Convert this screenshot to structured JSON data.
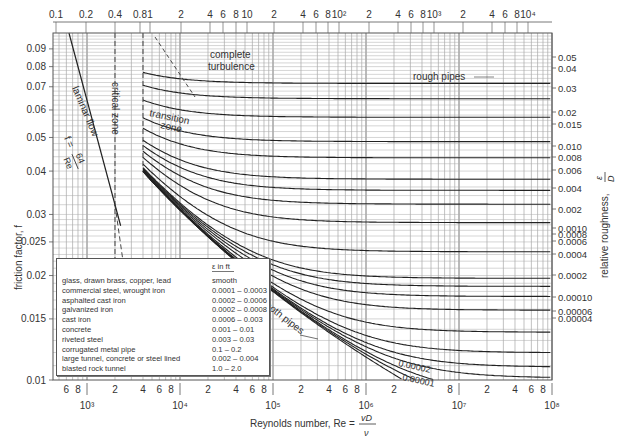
{
  "chart_data": {
    "type": "line",
    "xlabel": "Reynolds number, Re = vD/ν",
    "xlabel_main": "Reynolds number, Re =",
    "xlabel_num": "vD",
    "xlabel_den": "ν",
    "ylabel": "friction factor, f",
    "y2label": "relative roughness, ε/D",
    "y2label_main": "relative roughness,",
    "y2label_num": "ε",
    "y2label_den": "D",
    "xscale": "log",
    "yscale": "log",
    "xlim": [
      430,
      100000000
    ],
    "ylim": [
      0.01,
      0.1
    ],
    "grid": true,
    "y_ticks": [
      "0.09",
      "0.08",
      "0.07",
      "0.06",
      "0.05",
      "0.04",
      "0.03",
      "0.025",
      "0.02",
      "0.015",
      "0.01"
    ],
    "y_tick_values": [
      0.09,
      0.08,
      0.07,
      0.06,
      0.05,
      0.04,
      0.03,
      0.025,
      0.02,
      0.015,
      0.01
    ],
    "x_major_ticks": [
      "10³",
      "10⁴",
      "10⁵",
      "10⁶",
      "10⁷",
      "10⁸"
    ],
    "x_major_values": [
      1000,
      10000,
      100000,
      1000000,
      10000000,
      100000000
    ],
    "x_minor_tick_labels": [
      "6",
      "8",
      "2",
      "4",
      "6",
      "8",
      "2",
      "4",
      "6",
      "8",
      "2",
      "4",
      "6",
      "8",
      "2",
      "8",
      "2",
      "4",
      "6",
      "8"
    ],
    "top_axis_labels": [
      "0.1",
      "0.2",
      "0.4",
      "0.8",
      "1",
      "2",
      "4",
      "6",
      "8",
      "10",
      "2",
      "4",
      "6",
      "8",
      "10²",
      "2",
      "4",
      "6",
      "8",
      "10³",
      "2",
      "4",
      "6",
      "8",
      "10⁴"
    ],
    "relative_roughness_labels": [
      "0.05",
      "0.04",
      "0.03",
      "0.02",
      "0.015",
      "0.010",
      "0.008",
      "0.006",
      "0.004",
      "0.002",
      "0.0010",
      "0.0008",
      "0.0006",
      "0.0004",
      "0.0002",
      "0.00010",
      "0.00006",
      "0.00004"
    ],
    "relative_roughness_values": [
      0.05,
      0.04,
      0.03,
      0.02,
      0.015,
      0.01,
      0.008,
      0.006,
      0.004,
      0.002,
      0.001,
      0.0008,
      0.0006,
      0.0004,
      0.0002,
      0.0001,
      6e-05,
      4e-05
    ],
    "inline_curve_labels": [
      "0.00002",
      "0.00001"
    ],
    "annotations": {
      "laminar": "laminar flow",
      "laminar_eq_lhs": "f =",
      "laminar_eq_num": "64",
      "laminar_eq_den": "Re",
      "critical": "critical zone",
      "transition_1": "transition",
      "transition_2": "zone",
      "complete_1": "complete",
      "complete_2": "turbulence",
      "rough": "rough pipes",
      "smooth": "smooth pipes"
    },
    "series": [
      {
        "name": "laminar f=64/Re",
        "x": [
          640,
          2300
        ],
        "y": [
          0.1,
          0.0278
        ]
      },
      {
        "name": "smooth pipes",
        "x": [
          4000,
          100000,
          1000000,
          10000000
        ],
        "y": [
          0.04,
          0.018,
          0.0116,
          0.0081
        ]
      }
    ]
  },
  "legend": {
    "header": "ε in ft",
    "rows": [
      {
        "material": "glass, drawn brass, copper, lead",
        "epsilon": "smooth"
      },
      {
        "material": "commercial steel, wrought iron",
        "epsilon": "0.0001 – 0.0003"
      },
      {
        "material": "asphalted cast iron",
        "epsilon": "0.0002 – 0.0006"
      },
      {
        "material": "galvanized iron",
        "epsilon": "0.0002 – 0.0008"
      },
      {
        "material": "cast iron",
        "epsilon": "0.0006 – 0.003"
      },
      {
        "material": "concrete",
        "epsilon": "0.001 – 0.01"
      },
      {
        "material": "riveted steel",
        "epsilon": "0.003 – 0.03"
      },
      {
        "material": "corrugated metal pipe",
        "epsilon": "0.1 – 0.2"
      },
      {
        "material": "large tunnel, concrete or steel lined",
        "epsilon": "0.002 – 0.004"
      },
      {
        "material": "blasted rock tunnel",
        "epsilon": "1.0 – 2.0"
      }
    ]
  }
}
